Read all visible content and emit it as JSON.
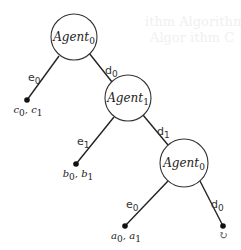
{
  "diagram": {
    "type": "game-tree",
    "nodes": [
      {
        "id": "root",
        "base": "Agent",
        "sub": "0"
      },
      {
        "id": "mid",
        "base": "Agent",
        "sub": "1"
      },
      {
        "id": "low",
        "base": "Agent",
        "sub": "0"
      }
    ],
    "edges": [
      {
        "from": "root",
        "to": "leaf_c",
        "base": "e",
        "sub": "0"
      },
      {
        "from": "root",
        "to": "mid",
        "base": "d",
        "sub": "0"
      },
      {
        "from": "mid",
        "to": "leaf_b",
        "base": "e",
        "sub": "1"
      },
      {
        "from": "mid",
        "to": "low",
        "base": "d",
        "sub": "1"
      },
      {
        "from": "low",
        "to": "leaf_a",
        "base": "e",
        "sub": "0"
      },
      {
        "from": "low",
        "to": "leaf_loop",
        "base": "d",
        "sub": "0"
      }
    ],
    "leaves": [
      {
        "id": "leaf_c",
        "v1": "c",
        "s1": "0",
        "v2": "c",
        "s2": "1"
      },
      {
        "id": "leaf_b",
        "v1": "b",
        "s1": "0",
        "v2": "b",
        "s2": "1"
      },
      {
        "id": "leaf_a",
        "v1": "a",
        "s1": "0",
        "v2": "a",
        "s2": "1"
      },
      {
        "id": "leaf_loop",
        "symbol": "↻"
      }
    ],
    "background_bleed": [
      "ithm Algorithm B",
      "Algor ithm C"
    ]
  }
}
